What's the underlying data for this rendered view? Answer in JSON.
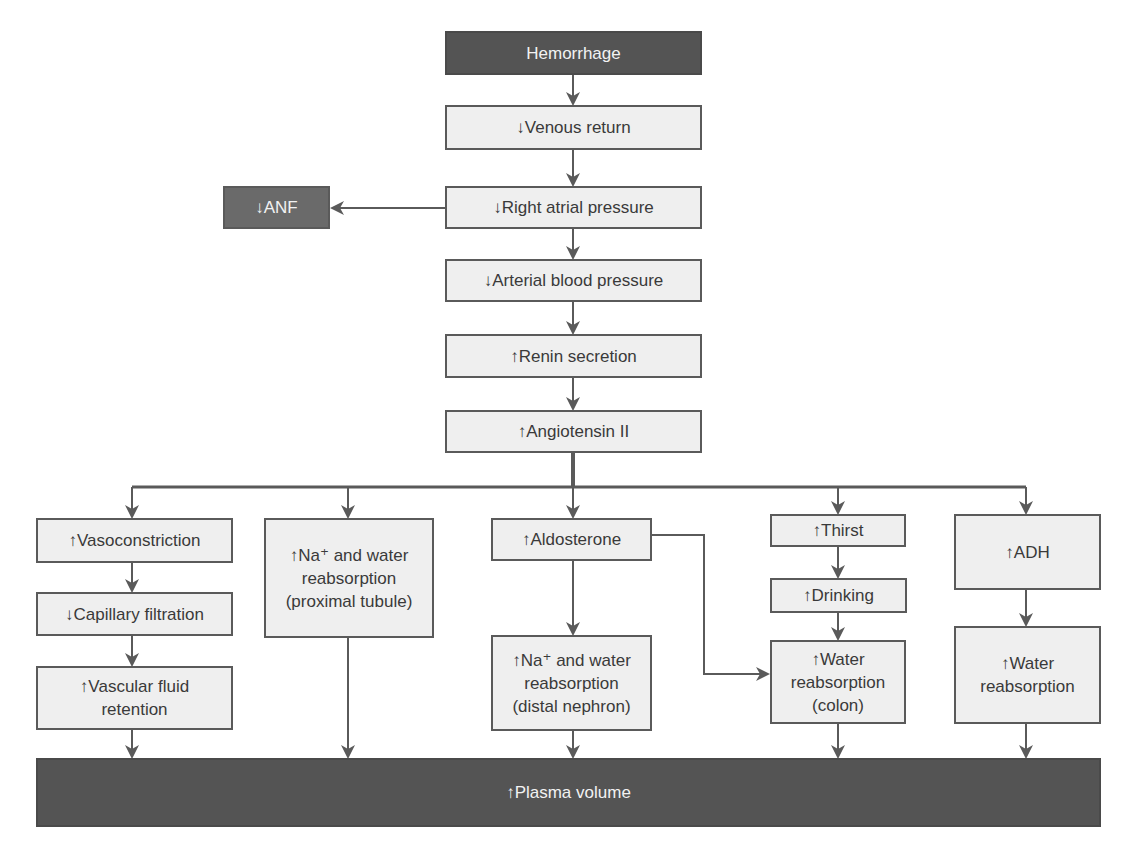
{
  "diagram": {
    "nodes": {
      "hemorrhage": "Hemorrhage",
      "venous_return": "↓Venous return",
      "anf": "↓ANF",
      "right_atrial_pressure": "↓Right atrial pressure",
      "arterial_bp": "↓Arterial blood pressure",
      "renin": "↑Renin secretion",
      "angiotensin": "↑Angiotensin II",
      "vasoconstriction": "↑Vasoconstriction",
      "capillary_filtration": "↓Capillary filtration",
      "vascular_retention": [
        "↑Vascular fluid",
        "retention"
      ],
      "na_proximal": [
        "↑Na⁺ and water",
        "reabsorption",
        "(proximal tubule)"
      ],
      "aldosterone": "↑Aldosterone",
      "na_distal": [
        "↑Na⁺ and water",
        "reabsorption",
        "(distal nephron)"
      ],
      "thirst": "↑Thirst",
      "drinking": "↑Drinking",
      "water_colon": [
        "↑Water",
        "reabsorption",
        "(colon)"
      ],
      "adh": "↑ADH",
      "water_reabsorption": [
        "↑Water",
        "reabsorption"
      ],
      "plasma_volume": "↑Plasma volume"
    },
    "colors": {
      "dark_fill": "#545454",
      "mid_fill": "#6a6a6a",
      "light_fill": "#efefef",
      "line": "#5a5a5a"
    }
  }
}
